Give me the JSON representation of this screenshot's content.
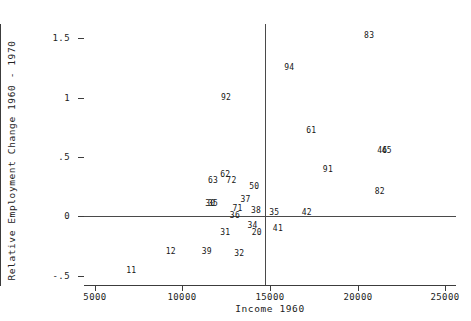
{
  "chart_data": {
    "type": "scatter",
    "title": "",
    "xlabel": "Income 1960",
    "ylabel": "Relative Employment Change 1960 - 1970",
    "xlim": [
      4400,
      25600
    ],
    "ylim": [
      -0.58,
      1.62
    ],
    "xticks": [
      5000,
      10000,
      15000,
      20000,
      25000
    ],
    "xticklabels": [
      "5000",
      "10000",
      "15000",
      "20000",
      "25000"
    ],
    "yticks": [
      1.5,
      1.0,
      0.5,
      0.0,
      -0.5
    ],
    "yticklabels": [
      "1.5",
      "1",
      ".5",
      "0",
      "-.5"
    ],
    "grid": false,
    "legend": null,
    "marker_style": "text-label",
    "reference_lines": [
      {
        "orientation": "horizontal",
        "value": 0.0
      },
      {
        "orientation": "vertical",
        "value": 14700
      }
    ],
    "points": [
      {
        "label": "83",
        "x": 20650,
        "y": 1.52
      },
      {
        "label": "94",
        "x": 16100,
        "y": 1.25
      },
      {
        "label": "92",
        "x": 12500,
        "y": 1.0
      },
      {
        "label": "61",
        "x": 17350,
        "y": 0.72
      },
      {
        "label": "46",
        "x": 21400,
        "y": 0.55
      },
      {
        "label": "45",
        "x": 21650,
        "y": 0.55
      },
      {
        "label": "91",
        "x": 18300,
        "y": 0.39
      },
      {
        "label": "62",
        "x": 12450,
        "y": 0.345
      },
      {
        "label": "72",
        "x": 12800,
        "y": 0.3
      },
      {
        "label": "63",
        "x": 11750,
        "y": 0.295
      },
      {
        "label": "50",
        "x": 14100,
        "y": 0.245
      },
      {
        "label": "82",
        "x": 21250,
        "y": 0.205
      },
      {
        "label": "37",
        "x": 13600,
        "y": 0.135
      },
      {
        "label": "30",
        "x": 11600,
        "y": 0.105
      },
      {
        "label": "35",
        "x": 11750,
        "y": 0.105
      },
      {
        "label": "71",
        "x": 13150,
        "y": 0.06
      },
      {
        "label": "38",
        "x": 14200,
        "y": 0.04
      },
      {
        "label": "35",
        "x": 15250,
        "y": 0.025
      },
      {
        "label": "42",
        "x": 17100,
        "y": 0.025
      },
      {
        "label": "36",
        "x": 13000,
        "y": 0.0
      },
      {
        "label": "34",
        "x": 14000,
        "y": -0.08
      },
      {
        "label": "41",
        "x": 15450,
        "y": -0.11
      },
      {
        "label": "20",
        "x": 14250,
        "y": -0.14
      },
      {
        "label": "31",
        "x": 12450,
        "y": -0.14
      },
      {
        "label": "12",
        "x": 9350,
        "y": -0.3
      },
      {
        "label": "39",
        "x": 11400,
        "y": -0.3
      },
      {
        "label": "32",
        "x": 13250,
        "y": -0.315
      },
      {
        "label": "11",
        "x": 7100,
        "y": -0.46
      }
    ]
  }
}
